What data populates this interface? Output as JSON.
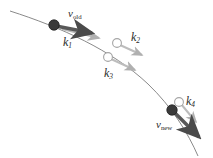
{
  "figure": {
    "title": "",
    "background": "#ffffff",
    "width": 213,
    "height": 158,
    "colors": {
      "curve": "#8a8a8a",
      "node_fill": "#3a3a3a",
      "node_stroke": "#1e1e1e",
      "open_node_stroke": "#9a9a9a",
      "arrow_dark": "#4a4a4a",
      "arrow_light": "#b4b4b4",
      "text": "#2a2a2a"
    }
  },
  "labels": {
    "v_old": {
      "base": "v",
      "sub": "old"
    },
    "v_new": {
      "base": "v",
      "sub": "new"
    },
    "k1": {
      "base": "k",
      "sub": "1"
    },
    "k2": {
      "base": "k",
      "sub": "2"
    },
    "k3": {
      "base": "k",
      "sub": "3"
    },
    "k4": {
      "base": "k",
      "sub": "4"
    }
  },
  "chart_data": {
    "type": "diagram",
    "title": "",
    "curve": {
      "name": "trajectory",
      "path": "M 10 11 C 60 27, 112 50, 148 84 C 172 107, 188 133, 198 156",
      "stroke": "#8a8a8a",
      "width": 1
    },
    "nodes": [
      {
        "id": "node-old",
        "label": "v_old",
        "x": 54,
        "y": 25,
        "r": 5.2,
        "style": "filled"
      },
      {
        "id": "node-k2",
        "label": "k2",
        "x": 117,
        "y": 43,
        "r": 4.4,
        "style": "open"
      },
      {
        "id": "node-k3",
        "label": "k3",
        "x": 108,
        "y": 57,
        "r": 4.4,
        "style": "open"
      },
      {
        "id": "node-k4",
        "label": "k4",
        "x": 179,
        "y": 102,
        "r": 4.4,
        "style": "open"
      },
      {
        "id": "node-new",
        "label": "v_new",
        "x": 172,
        "y": 110,
        "r": 5.2,
        "style": "filled"
      }
    ],
    "arrows": [
      {
        "id": "arrow-vold",
        "label": "v_old",
        "x1": 56,
        "y1": 26,
        "x2": 92,
        "y2": 33,
        "tone": "dark",
        "head": 7.0
      },
      {
        "id": "arrow-k1",
        "label": "k1",
        "x1": 62,
        "y1": 29,
        "x2": 99,
        "y2": 38,
        "tone": "light",
        "head": 5.0
      },
      {
        "id": "arrow-k2",
        "label": "k2",
        "x1": 120,
        "y1": 45,
        "x2": 142,
        "y2": 55,
        "tone": "light",
        "head": 5.0
      },
      {
        "id": "arrow-k3",
        "label": "k3",
        "x1": 111,
        "y1": 59,
        "x2": 135,
        "y2": 70,
        "tone": "light",
        "head": 5.0
      },
      {
        "id": "arrow-k4",
        "label": "k4",
        "x1": 181,
        "y1": 104,
        "x2": 196,
        "y2": 122,
        "tone": "light",
        "head": 5.0
      },
      {
        "id": "arrow-vnew",
        "label": "v_new",
        "x1": 174,
        "y1": 112,
        "x2": 199,
        "y2": 137,
        "tone": "dark",
        "head": 7.0
      }
    ],
    "label_positions": [
      {
        "label": "v_old",
        "x": 68,
        "y": 8
      },
      {
        "label": "k1",
        "x": 63,
        "y": 36
      },
      {
        "label": "k2",
        "x": 131,
        "y": 31
      },
      {
        "label": "k3",
        "x": 104,
        "y": 67
      },
      {
        "label": "k4",
        "x": 186,
        "y": 95
      },
      {
        "label": "v_new",
        "x": 156,
        "y": 119
      }
    ]
  }
}
